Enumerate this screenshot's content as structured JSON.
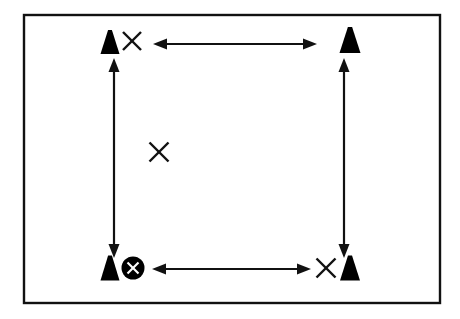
{
  "diagram": {
    "background_color": "#ffffff",
    "ink_color": "#111111",
    "marker_color": "#000000",
    "frame": {
      "label": "boundary-frame",
      "x": 24,
      "y": 15,
      "width": 416,
      "height": 288,
      "stroke_width": 2.4
    },
    "cones": [
      {
        "label": "cone-top-left",
        "cx": 110,
        "cy": 42,
        "half_width": 9.5,
        "height": 24
      },
      {
        "label": "cone-top-right",
        "cx": 350,
        "cy": 40,
        "half_width": 10.5,
        "height": 26
      },
      {
        "label": "cone-bottom-left",
        "cx": 110,
        "cy": 268,
        "half_width": 9.5,
        "height": 25
      },
      {
        "label": "cone-bottom-right",
        "cx": 350,
        "cy": 268,
        "half_width": 10.0,
        "height": 25
      }
    ],
    "x_marks": [
      {
        "label": "x-mark-top-left",
        "cx": 132,
        "cy": 41,
        "size": 18
      },
      {
        "label": "x-mark-middle-left",
        "cx": 159,
        "cy": 152,
        "size": 19
      },
      {
        "label": "x-mark-bottom-right",
        "cx": 326,
        "cy": 268,
        "size": 19
      }
    ],
    "station": {
      "label": "station-marker-circled-x",
      "cx": 133,
      "cy": 268,
      "radius": 11.5,
      "inner_x_size": 11
    },
    "arrows": [
      {
        "label": "dimension-arrow-top",
        "orientation": "horizontal",
        "x1": 153,
        "y1": 44,
        "x2": 317,
        "y2": 44,
        "double_headed": true
      },
      {
        "label": "dimension-arrow-bottom",
        "orientation": "horizontal",
        "x1": 152,
        "y1": 269,
        "x2": 311,
        "y2": 269,
        "double_headed": true
      },
      {
        "label": "dimension-arrow-left",
        "orientation": "vertical",
        "x1": 114,
        "y1": 58,
        "x2": 114,
        "y2": 258,
        "double_headed": true
      },
      {
        "label": "dimension-arrow-right",
        "orientation": "vertical",
        "x1": 344,
        "y1": 58,
        "x2": 344,
        "y2": 258,
        "double_headed": true
      }
    ],
    "arrow_head": {
      "length": 14,
      "half_width": 5.5
    }
  }
}
